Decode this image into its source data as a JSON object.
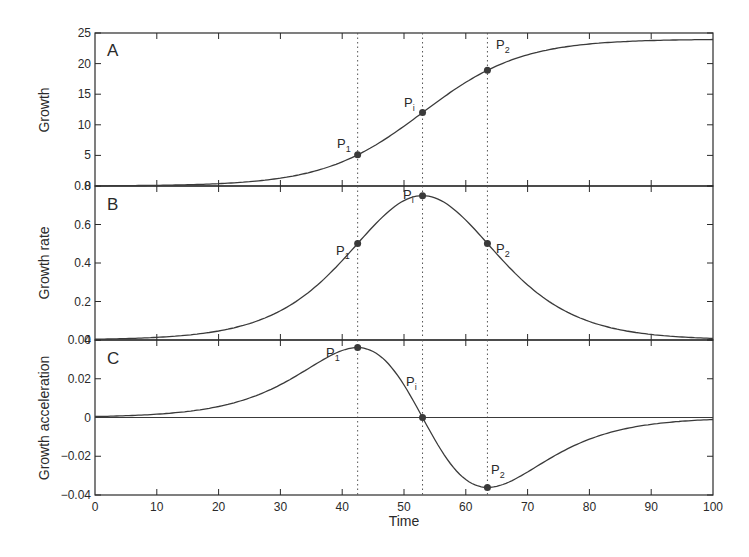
{
  "chart_data": [
    {
      "panel": "A",
      "type": "line",
      "ylabel": "Growth",
      "xlabel": "",
      "xlim": [
        0,
        100
      ],
      "ylim": [
        0,
        25
      ],
      "yticks": [
        0,
        5,
        10,
        15,
        20,
        25
      ],
      "xticks": [
        0,
        10,
        20,
        30,
        40,
        50,
        60,
        70,
        80,
        90,
        100
      ],
      "grid": false,
      "model": {
        "kind": "logistic",
        "K": 24,
        "r": 0.125,
        "t_inflection": 53
      },
      "x": [
        0,
        10,
        20,
        30,
        40,
        42.5,
        50,
        53,
        60,
        63.5,
        70,
        80,
        90,
        100
      ],
      "values": [
        0.03,
        0.11,
        0.38,
        1.28,
        3.93,
        5.07,
        9.32,
        12.0,
        17.65,
        18.93,
        21.97,
        23.43,
        23.85,
        23.96
      ],
      "points": [
        {
          "label": "P1",
          "x": 42.5,
          "y": 5.07
        },
        {
          "label": "Pi",
          "x": 53,
          "y": 12.0
        },
        {
          "label": "P2",
          "x": 63.5,
          "y": 18.93
        }
      ]
    },
    {
      "panel": "B",
      "type": "line",
      "ylabel": "Growth rate",
      "xlabel": "",
      "xlim": [
        0,
        100
      ],
      "ylim": [
        0,
        0.8
      ],
      "yticks": [
        0,
        0.2,
        0.4,
        0.6,
        0.8
      ],
      "xticks": [
        0,
        10,
        20,
        30,
        40,
        50,
        60,
        70,
        80,
        90,
        100
      ],
      "grid": false,
      "x": [
        0,
        10,
        20,
        30,
        40,
        42.5,
        50,
        53,
        60,
        63.5,
        70,
        80,
        90,
        100
      ],
      "values": [
        0.004,
        0.014,
        0.047,
        0.153,
        0.42,
        0.5,
        0.71,
        0.75,
        0.54,
        0.5,
        0.31,
        0.1,
        0.03,
        0.009
      ],
      "points": [
        {
          "label": "P1",
          "x": 42.5,
          "y": 0.5
        },
        {
          "label": "Pi",
          "x": 53,
          "y": 0.75
        },
        {
          "label": "P2",
          "x": 63.5,
          "y": 0.5
        }
      ]
    },
    {
      "panel": "C",
      "type": "line",
      "ylabel": "Growth acceleration",
      "xlabel": "Time",
      "xlim": [
        0,
        100
      ],
      "ylim": [
        -0.04,
        0.04
      ],
      "yticks": [
        -0.04,
        -0.02,
        0,
        0.02,
        0.04
      ],
      "xticks": [
        0,
        10,
        20,
        30,
        40,
        50,
        60,
        70,
        80,
        90,
        100
      ],
      "grid": false,
      "x": [
        0,
        10,
        20,
        30,
        40,
        42.5,
        50,
        53,
        60,
        63.5,
        70,
        80,
        90,
        100
      ],
      "values": [
        0.0005,
        0.0017,
        0.0058,
        0.018,
        0.034,
        0.036,
        0.018,
        0.0,
        -0.03,
        -0.036,
        -0.026,
        -0.011,
        -0.004,
        -0.001
      ],
      "points": [
        {
          "label": "P1",
          "x": 42.5,
          "y": 0.036
        },
        {
          "label": "Pi",
          "x": 53,
          "y": 0.0
        },
        {
          "label": "P2",
          "x": 63.5,
          "y": -0.036
        }
      ]
    }
  ],
  "labels": {
    "panelA": "A",
    "panelB": "B",
    "panelC": "C",
    "ylabelA": "Growth",
    "ylabelB": "Growth rate",
    "ylabelC": "Growth acceleration",
    "xlabel": "Time",
    "P": "P",
    "sub1": "1",
    "subi": "i",
    "sub2": "2"
  },
  "ticklabels": {
    "x": [
      "0",
      "10",
      "20",
      "30",
      "40",
      "50",
      "60",
      "70",
      "80",
      "90",
      "100"
    ],
    "yA": [
      "0",
      "5",
      "10",
      "15",
      "20",
      "25"
    ],
    "yB": [
      "0",
      "0.2",
      "0.4",
      "0.6",
      "0.8"
    ],
    "yC": [
      "−0.04",
      "−0.02",
      "0",
      "0.02",
      "0.04"
    ]
  },
  "colors": {
    "line": "#3a3a3a",
    "axis": "#2a2a2a",
    "point": "#3a3a3a",
    "vline": "#555555"
  }
}
